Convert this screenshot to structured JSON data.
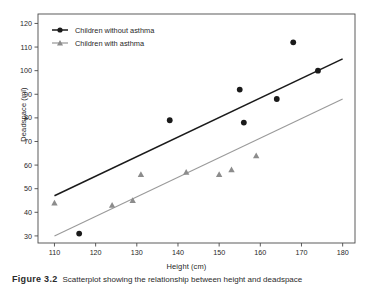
{
  "chart_data": {
    "type": "scatter",
    "title": "",
    "xlabel": "Height (cm)",
    "ylabel": "Deadspace (ml)",
    "xlim": [
      106,
      183
    ],
    "ylim": [
      27,
      124
    ],
    "xticks": [
      110,
      120,
      130,
      140,
      150,
      160,
      170,
      180
    ],
    "yticks": [
      30,
      40,
      50,
      60,
      70,
      80,
      90,
      100,
      110,
      120
    ],
    "grid": false,
    "frame": true,
    "legend_position": "top-left",
    "series": [
      {
        "name": "Children without asthma",
        "marker": "circle",
        "color": "#1a1a1a",
        "points": [
          {
            "x": 116,
            "y": 31
          },
          {
            "x": 138,
            "y": 79
          },
          {
            "x": 155,
            "y": 92
          },
          {
            "x": 156,
            "y": 78
          },
          {
            "x": 164,
            "y": 88
          },
          {
            "x": 168,
            "y": 112
          },
          {
            "x": 174,
            "y": 100
          }
        ],
        "fit_line": {
          "x1": 110,
          "y1": 47,
          "x2": 180,
          "y2": 105,
          "color": "#1a1a1a"
        }
      },
      {
        "name": "Children with asthma",
        "marker": "triangle",
        "color": "#8c8c8c",
        "points": [
          {
            "x": 110,
            "y": 44
          },
          {
            "x": 124,
            "y": 43
          },
          {
            "x": 129,
            "y": 45
          },
          {
            "x": 131,
            "y": 56
          },
          {
            "x": 142,
            "y": 57
          },
          {
            "x": 150,
            "y": 56
          },
          {
            "x": 153,
            "y": 58
          },
          {
            "x": 159,
            "y": 64
          }
        ],
        "fit_line": {
          "x1": 110,
          "y1": 30,
          "x2": 180,
          "y2": 88,
          "color": "#9a9a9a"
        }
      }
    ]
  },
  "legend": {
    "entries": [
      {
        "label": "Children without asthma"
      },
      {
        "label": "Children with asthma"
      }
    ]
  },
  "caption": {
    "label": "Figure 3.2",
    "text": "Scatterplot showing the relationship between height and deadspace"
  },
  "colors": {
    "series_without_asthma": "#1a1a1a",
    "series_with_asthma": "#8c8c8c",
    "axis": "#4a4a4a",
    "background": "#ffffff"
  }
}
